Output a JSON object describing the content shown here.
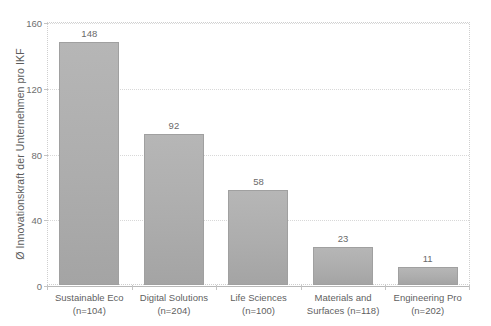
{
  "chart_data": {
    "type": "bar",
    "title": "",
    "xlabel": "",
    "ylabel": "Ø Innovationskraft der Unternehmen pro IKF",
    "ylim": [
      0,
      160
    ],
    "yticks": [
      0,
      40,
      80,
      120,
      160
    ],
    "grid": true,
    "legend": "none",
    "categories": [
      "Sustainable Eco",
      "Digital Solutions",
      "Life Sciences",
      "Materials and Surfaces",
      "Engineering Pro"
    ],
    "category_lines": [
      [
        "Sustainable Eco",
        "(n=104)"
      ],
      [
        "Digital Solutions",
        "(n=204)"
      ],
      [
        "Life Sciences",
        "(n=100)"
      ],
      [
        "Materials and",
        "Surfaces (n=118)"
      ],
      [
        "Engineering Pro",
        "(n=202)"
      ]
    ],
    "sample_sizes": [
      104,
      204,
      100,
      118,
      202
    ],
    "values": [
      148,
      92,
      58,
      23,
      11
    ],
    "value_labels": [
      "148",
      "92",
      "58",
      "23",
      "11"
    ],
    "bar_color": "#adadad",
    "bar_border_color": "#a0a0a0",
    "grid_color": "#d8d8d8",
    "axis_color": "#b9b9b9",
    "text_color": "#5f5f5f"
  }
}
